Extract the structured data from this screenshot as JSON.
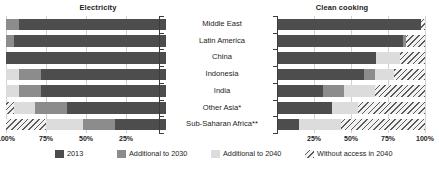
{
  "chart_data": {
    "type": "bar",
    "orientation": "horizontal",
    "layout": "two-panel back-to-back stacked bar",
    "title": "",
    "panels": [
      {
        "key": "electricity",
        "title": "Electricity",
        "xlabel": "",
        "ylabel": "",
        "xlim": [
          0,
          100
        ],
        "axis_direction": "reversed",
        "tick_labels": [
          "100%",
          "75%",
          "50%",
          "25%"
        ],
        "tick_values": [
          100,
          75,
          50,
          25
        ],
        "grid": true,
        "categories": [
          "Middle East",
          "Latin America",
          "China",
          "Indonesia",
          "India",
          "Other Asia*",
          "Sub-Saharan Africa**"
        ],
        "series": [
          {
            "name": "2013",
            "values": [
              92,
              95,
              100,
              78,
              78,
              62,
              32
            ]
          },
          {
            "name": "Additional to 2030",
            "values": [
              8,
              5,
              0,
              14,
              14,
              20,
              20
            ]
          },
          {
            "name": "Additional to 2040",
            "values": [
              0,
              0,
              0,
              8,
              8,
              13,
              23
            ]
          },
          {
            "name": "Without access in 2040",
            "values": [
              0,
              0,
              0,
              0,
              0,
              5,
              25
            ]
          }
        ]
      },
      {
        "key": "clean_cooking",
        "title": "Clean cooking",
        "xlabel": "",
        "ylabel": "",
        "xlim": [
          0,
          100
        ],
        "axis_direction": "normal",
        "tick_labels": [
          "25%",
          "50%",
          "75%",
          "100%"
        ],
        "tick_values": [
          25,
          50,
          75,
          100
        ],
        "grid": true,
        "categories": [
          "Middle East",
          "Latin America",
          "China",
          "Indonesia",
          "India",
          "Other Asia*",
          "Sub-Saharan Africa**"
        ],
        "series": [
          {
            "name": "2013",
            "values": [
              97,
              85,
              67,
              59,
              31,
              37,
              15
            ]
          },
          {
            "name": "Additional to 2030",
            "values": [
              0,
              2,
              0,
              7,
              14,
              0,
              0
            ]
          },
          {
            "name": "Additional to 2040",
            "values": [
              0,
              0,
              16,
              13,
              21,
              18,
              28
            ]
          },
          {
            "name": "Without access in 2040",
            "values": [
              3,
              13,
              17,
              21,
              34,
              45,
              57
            ]
          }
        ]
      }
    ],
    "legend": {
      "position": "bottom",
      "entries": [
        {
          "label": "2013",
          "swatch": "solid-dark",
          "color": "#4d4d4d"
        },
        {
          "label": "Additional to 2030",
          "swatch": "solid-medium",
          "color": "#8c8c8c"
        },
        {
          "label": "Additional to 2040",
          "swatch": "solid-light",
          "color": "#dcdcdc"
        },
        {
          "label": "Without access in 2040",
          "swatch": "hatched",
          "color": "#5a5a5a"
        }
      ]
    }
  }
}
